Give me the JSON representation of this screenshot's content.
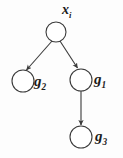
{
  "diagram": {
    "type": "directed-graph",
    "title_visible": false,
    "background_color": "#fdfdfd",
    "stroke_color": "#3a3a3a",
    "label_color": "#1b1b1b",
    "nodes": [
      {
        "id": "root",
        "label_base": "x",
        "label_sub": "i",
        "label_text": "xi",
        "cx": 56,
        "cy": 32,
        "r": 10,
        "label_x": 62,
        "label_y": 4
      },
      {
        "id": "g2",
        "label_base": "g",
        "label_sub": "2",
        "label_text": "g2",
        "cx": 23,
        "cy": 81,
        "r": 11,
        "label_x": 34,
        "label_y": 74
      },
      {
        "id": "g1",
        "label_base": "g",
        "label_sub": "1",
        "label_text": "g1",
        "cx": 81,
        "cy": 80,
        "r": 11,
        "label_x": 94,
        "label_y": 73
      },
      {
        "id": "g3",
        "label_base": "g",
        "label_sub": "3",
        "label_text": "g3",
        "cx": 81,
        "cy": 137,
        "r": 11,
        "label_x": 95,
        "label_y": 130
      }
    ],
    "edges": [
      {
        "id": "root-to-g2",
        "from": "root",
        "to": "g2",
        "x1": 52,
        "y1": 41,
        "x2": 26,
        "y2": 70,
        "arrowhead": true
      },
      {
        "id": "root-to-g1",
        "from": "root",
        "to": "g1",
        "x1": 60,
        "y1": 41,
        "x2": 78,
        "y2": 68,
        "arrowhead": true
      },
      {
        "id": "g1-to-g3",
        "from": "g1",
        "to": "g3",
        "x1": 81,
        "y1": 91,
        "x2": 81,
        "y2": 125,
        "arrowhead": true
      }
    ]
  }
}
